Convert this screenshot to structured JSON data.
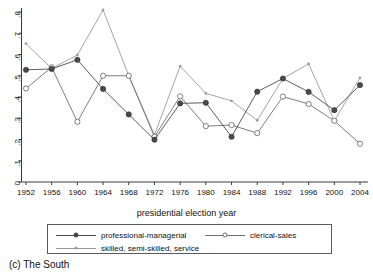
{
  "caption": "(c) The South",
  "chart_data": {
    "type": "line",
    "title": "",
    "subtitle": "",
    "xlabel": "presidential election year",
    "ylabel": "",
    "grid": false,
    "legend_position": "bottom",
    "categories": [
      1952,
      1956,
      1960,
      1964,
      1968,
      1972,
      1976,
      1980,
      1984,
      1988,
      1992,
      1996,
      2000,
      2004
    ],
    "xtick_labels": [
      "1952",
      "1956",
      "1960",
      "1964",
      "1968",
      "1972",
      "1976",
      "1980",
      "1984",
      "1988",
      "1992",
      "1996",
      "2000",
      "2004"
    ],
    "ytick_labels": [
      "0",
      ".1",
      ".2",
      ".3",
      ".4",
      ".5",
      ".6",
      ".7",
      ".8"
    ],
    "ytick_values": [
      0,
      0.1,
      0.2,
      0.3,
      0.4,
      0.5,
      0.6,
      0.7,
      0.8
    ],
    "ylim": [
      0,
      0.83
    ],
    "xlim": [
      1950,
      2006
    ],
    "series": [
      {
        "name": "professional-managerial",
        "marker": "filled-circle",
        "color": "#4a4a4a",
        "values": [
          0.528,
          0.532,
          0.575,
          0.438,
          0.318,
          0.199,
          0.37,
          0.373,
          0.213,
          0.425,
          0.487,
          0.424,
          0.338,
          0.456
        ]
      },
      {
        "name": "clerical-sales",
        "marker": "open-circle",
        "color": "#6f6f6f",
        "values": [
          0.44,
          0.54,
          0.283,
          0.5,
          0.5,
          0.213,
          0.403,
          0.263,
          0.268,
          0.23,
          0.402,
          0.367,
          0.288,
          0.18
        ]
      },
      {
        "name": "skilled, semi-skilled, service",
        "marker": "small-dot",
        "color": "#9a9a9a",
        "values": [
          0.651,
          0.534,
          0.598,
          0.81,
          0.5,
          0.222,
          0.545,
          0.417,
          0.382,
          0.29,
          0.487,
          0.556,
          0.288,
          0.49
        ]
      }
    ]
  },
  "legend": {
    "items": [
      {
        "label": "professional-managerial"
      },
      {
        "label": "clerical-sales"
      },
      {
        "label": "skilled, semi-skilled, service"
      }
    ]
  }
}
